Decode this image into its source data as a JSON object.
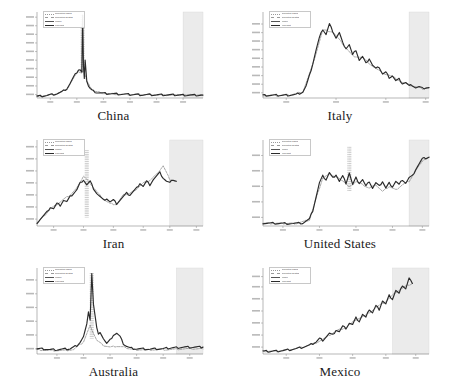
{
  "figure": {
    "background": "#ffffff",
    "panel_background": "#ffffff",
    "axis_color": "#888888",
    "line_color": "#2b2b2b",
    "secondary_line_color": "#777777",
    "forecast_band_color": "#ebebeb",
    "layout": {
      "rows": 3,
      "cols": 2
    }
  },
  "legend": {
    "entries": [
      {
        "label": "Reported cases",
        "color": "#9a9a9a",
        "style": "dotted"
      },
      {
        "label": "Reported deaths",
        "color": "#9a9a9a",
        "style": "dashed"
      },
      {
        "label": "Model",
        "color": "#555555",
        "style": "solid"
      },
      {
        "label": "Forecast",
        "color": "#2b2b2b",
        "style": "solid"
      }
    ]
  },
  "panels": [
    {
      "name": "China",
      "caption": "China"
    },
    {
      "name": "Italy",
      "caption": "Italy"
    },
    {
      "name": "Iran",
      "caption": "Iran"
    },
    {
      "name": "United States",
      "caption": "United States"
    },
    {
      "name": "Australia",
      "caption": "Australia"
    },
    {
      "name": "Mexico",
      "caption": "Mexico"
    }
  ],
  "chart_data": {
    "type": "line",
    "title": "",
    "xlabel": "",
    "ylabel": "",
    "grid": false,
    "legend_position": "top-left",
    "shared_notes": "Small-multiples of epidemic curves by country. Each panel: x = days since outbreak start, y = daily counts (log-like scale, unlabeled ticks). Grey band on the right of each panel marks the forecast / projection window. Dotted vertical hatching marks wide uncertainty intervals.",
    "axis_ranges": {
      "x": [
        0,
        100
      ],
      "y": [
        0,
        100
      ]
    },
    "panels": [
      {
        "name": "China",
        "caption": "China",
        "forecast_start": 88,
        "xticks": [
          8,
          24,
          40,
          56,
          72,
          88
        ],
        "yticks": [
          4,
          14,
          24,
          34,
          44,
          54,
          64,
          74,
          84,
          94
        ],
        "spike_x": 27.5,
        "spike_top": 96,
        "spike_bottom": 30,
        "series": [
          {
            "name": "Model",
            "x": [
              0,
              3,
              6,
              9,
              12,
              15,
              18,
              20,
              22,
              24,
              25,
              26,
              27,
              27.5,
              28,
              28.5,
              29,
              30,
              31,
              32,
              33,
              34,
              36,
              38,
              40,
              44,
              48,
              52,
              56,
              60,
              64,
              68,
              72,
              76,
              80,
              84,
              88,
              92,
              96,
              100
            ],
            "y": [
              2,
              2.5,
              3,
              4,
              5,
              7,
              11,
              17,
              24,
              30,
              33,
              33,
              30,
              96,
              36,
              24,
              45,
              20,
              14,
              11,
              9,
              8,
              6.5,
              6,
              5.5,
              5,
              4.5,
              4.2,
              4,
              4,
              3.8,
              3.8,
              3.6,
              3.6,
              3.5,
              3.5,
              3.5,
              3.4,
              3.4,
              3.4
            ]
          },
          {
            "name": "Reported",
            "x": [
              0,
              6,
              12,
              18,
              22,
              25,
              27,
              28,
              30,
              34,
              40,
              48,
              56,
              64,
              72,
              80,
              88,
              96,
              100
            ],
            "y": [
              2,
              3,
              5,
              10,
              23,
              31,
              29,
              34,
              19,
              8,
              5.5,
              4.4,
              4,
              3.8,
              3.6,
              3.5,
              3.5,
              3.4,
              3.4
            ]
          }
        ]
      },
      {
        "name": "Italy",
        "caption": "Italy",
        "forecast_start": 88,
        "xticks": [
          14,
          44,
          74,
          98
        ],
        "yticks": [
          6,
          16,
          26,
          36,
          46,
          56,
          66,
          76,
          86
        ],
        "series": [
          {
            "name": "Model",
            "x": [
              0,
              4,
              8,
              12,
              16,
              20,
              24,
              26,
              28,
              30,
              32,
              34,
              36,
              38,
              40,
              42,
              44,
              46,
              48,
              50,
              52,
              54,
              56,
              58,
              60,
              62,
              64,
              66,
              68,
              70,
              72,
              74,
              76,
              78,
              80,
              82,
              84,
              86,
              88,
              90,
              92,
              94,
              96,
              98,
              100
            ],
            "y": [
              3,
              3,
              3,
              3.2,
              3.5,
              4,
              7,
              14,
              26,
              40,
              56,
              70,
              80,
              74,
              86,
              78,
              70,
              76,
              64,
              58,
              62,
              50,
              56,
              44,
              48,
              40,
              46,
              38,
              34,
              36,
              28,
              30,
              24,
              26,
              20,
              22,
              17,
              18,
              14,
              15,
              12,
              13,
              11,
              12,
              12
            ]
          },
          {
            "name": "Reported",
            "x": [
              0,
              8,
              16,
              24,
              30,
              36,
              42,
              48,
              54,
              60,
              66,
              72,
              78,
              84,
              90,
              96,
              100
            ],
            "y": [
              3,
              3,
              3.4,
              7,
              39,
              79,
              77,
              63,
              49,
              47,
              37,
              29,
              25,
              18,
              14,
              11,
              12
            ]
          }
        ]
      },
      {
        "name": "Iran",
        "caption": "Iran",
        "forecast_start": 80,
        "xticks": [
          10,
          28,
          46,
          64,
          80,
          96
        ],
        "yticks": [
          8,
          22,
          36,
          50,
          64,
          78,
          92
        ],
        "spike_x": 30,
        "spike_top": 88,
        "spike_bottom": 10,
        "series": [
          {
            "name": "Model",
            "x": [
              0,
              2,
              4,
              6,
              8,
              10,
              12,
              14,
              16,
              18,
              20,
              22,
              24,
              26,
              28,
              30,
              32,
              34,
              36,
              38,
              40,
              42,
              44,
              46,
              48,
              50,
              52,
              54,
              56,
              58,
              60,
              62,
              64,
              66,
              68,
              70,
              72,
              74,
              76,
              78,
              80,
              82,
              84
            ],
            "y": [
              4,
              8,
              12,
              16,
              22,
              20,
              26,
              24,
              30,
              28,
              34,
              38,
              42,
              50,
              54,
              48,
              52,
              44,
              38,
              34,
              30,
              32,
              28,
              30,
              26,
              30,
              34,
              38,
              36,
              40,
              44,
              50,
              46,
              52,
              48,
              54,
              58,
              62,
              56,
              52,
              50,
              54,
              52
            ]
          },
          {
            "name": "Reported",
            "x": [
              0,
              4,
              8,
              12,
              16,
              20,
              24,
              28,
              32,
              36,
              40,
              44,
              48,
              52,
              56,
              60,
              64,
              68,
              72,
              76,
              80,
              84
            ],
            "y": [
              4,
              11,
              20,
              25,
              31,
              36,
              44,
              58,
              50,
              40,
              31,
              26,
              25,
              36,
              38,
              43,
              50,
              53,
              60,
              70,
              54,
              52
            ]
          }
        ]
      },
      {
        "name": "United States",
        "caption": "United States",
        "forecast_start": 88,
        "xticks": [
          12,
          34,
          56,
          78,
          96
        ],
        "yticks": [
          10,
          28,
          46,
          64,
          82
        ],
        "spike_x": 52,
        "spike_top": 92,
        "spike_bottom": 40,
        "series": [
          {
            "name": "Model",
            "x": [
              0,
              6,
              12,
              18,
              24,
              28,
              30,
              32,
              34,
              36,
              38,
              40,
              42,
              44,
              46,
              48,
              50,
              52,
              54,
              56,
              58,
              60,
              62,
              64,
              66,
              68,
              70,
              72,
              74,
              76,
              78,
              80,
              82,
              84,
              86,
              88,
              90,
              92,
              94,
              96,
              100
            ],
            "y": [
              3,
              3,
              3,
              3,
              3.5,
              8,
              18,
              34,
              50,
              58,
              54,
              62,
              56,
              60,
              52,
              58,
              50,
              62,
              48,
              56,
              50,
              54,
              46,
              52,
              44,
              50,
              46,
              52,
              44,
              50,
              46,
              52,
              48,
              54,
              50,
              56,
              58,
              66,
              72,
              78,
              80
            ]
          },
          {
            "name": "Reported",
            "x": [
              0,
              10,
              20,
              28,
              32,
              36,
              40,
              44,
              48,
              52,
              56,
              60,
              64,
              68,
              72,
              76,
              80,
              84,
              88,
              92,
              96,
              100
            ],
            "y": [
              3,
              3,
              3,
              7,
              32,
              56,
              60,
              57,
              53,
              45,
              52,
              48,
              44,
              48,
              40,
              46,
              42,
              48,
              52,
              64,
              76,
              80
            ]
          }
        ]
      },
      {
        "name": "Australia",
        "caption": "Australia",
        "forecast_start": 84,
        "xticks": [
          12,
          28,
          44,
          60,
          76,
          92
        ],
        "yticks": [
          6,
          22,
          38,
          54,
          70,
          86
        ],
        "spike_x": 33,
        "spike_top": 94,
        "spike_bottom": 18,
        "series": [
          {
            "name": "Model",
            "x": [
              0,
              4,
              8,
              12,
              16,
              20,
              24,
              26,
              28,
              30,
              31,
              32,
              33,
              34,
              35,
              36,
              37,
              38,
              40,
              42,
              44,
              46,
              48,
              50,
              52,
              54,
              56,
              60,
              64,
              68,
              72,
              76,
              80,
              84,
              88,
              92,
              96,
              100
            ],
            "y": [
              6,
              6,
              5,
              5,
              5.5,
              6,
              10,
              14,
              20,
              34,
              50,
              40,
              94,
              58,
              44,
              30,
              22,
              26,
              18,
              12,
              16,
              22,
              24,
              20,
              12,
              9,
              7,
              6,
              6,
              5.5,
              6,
              6,
              7,
              7.5,
              8,
              8,
              8,
              8
            ]
          },
          {
            "name": "Reported",
            "x": [
              0,
              8,
              16,
              22,
              28,
              32,
              36,
              40,
              44,
              48,
              52,
              56,
              60,
              66,
              72,
              78,
              84,
              90,
              96,
              100
            ],
            "y": [
              5,
              4,
              4,
              5,
              14,
              33,
              16,
              10,
              8,
              9,
              8,
              6,
              5,
              5,
              5,
              5,
              5.5,
              6,
              6,
              6
            ]
          }
        ]
      },
      {
        "name": "Mexico",
        "caption": "Mexico",
        "forecast_start": 78,
        "xticks": [
          14,
          34,
          54,
          74,
          92
        ],
        "yticks": [
          8,
          22,
          36,
          50,
          64,
          78,
          90
        ],
        "series": [
          {
            "name": "Model",
            "x": [
              0,
              4,
              8,
              12,
              16,
              20,
              24,
              28,
              32,
              34,
              36,
              38,
              40,
              42,
              44,
              46,
              48,
              50,
              52,
              54,
              56,
              58,
              60,
              62,
              64,
              66,
              68,
              70,
              72,
              74,
              76,
              78,
              80,
              82,
              84,
              86,
              88,
              90
            ],
            "y": [
              3,
              3,
              3.5,
              4,
              5,
              6,
              8,
              10,
              14,
              18,
              16,
              20,
              24,
              22,
              28,
              26,
              32,
              30,
              36,
              34,
              42,
              38,
              46,
              42,
              52,
              48,
              56,
              52,
              62,
              58,
              68,
              64,
              74,
              70,
              80,
              76,
              88,
              82
            ]
          },
          {
            "name": "Reported",
            "x": [
              0,
              8,
              16,
              24,
              32,
              38,
              44,
              50,
              56,
              62,
              68,
              74,
              80,
              86,
              90
            ],
            "y": [
              3,
              3.5,
              5,
              8,
              13,
              19,
              27,
              31,
              40,
              45,
              54,
              61,
              72,
              79,
              82
            ]
          }
        ]
      }
    ]
  }
}
